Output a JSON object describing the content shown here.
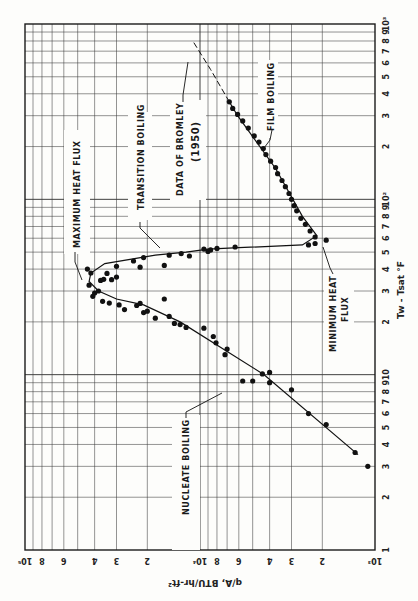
{
  "chart_data": {
    "type": "scatter",
    "orientation": "rotated-90",
    "title": "",
    "xlabel": "Tw - Tsat °F",
    "ylabel": "q/A, BTU/hr-ft²",
    "xscale": "log",
    "yscale": "log",
    "xlim": [
      1,
      1000
    ],
    "ylim": [
      1000,
      100000
    ],
    "grid": true,
    "x_ticks": [
      {
        "v": 1,
        "t": "1"
      },
      {
        "v": 2,
        "t": "2"
      },
      {
        "v": 3,
        "t": "3"
      },
      {
        "v": 4,
        "t": "4"
      },
      {
        "v": 5,
        "t": "5"
      },
      {
        "v": 6,
        "t": "6"
      },
      {
        "v": 7,
        "t": "7"
      },
      {
        "v": 8,
        "t": "8"
      },
      {
        "v": 9,
        "t": "9"
      },
      {
        "v": 10,
        "t": "10"
      },
      {
        "v": 20,
        "t": "2"
      },
      {
        "v": 30,
        "t": "3"
      },
      {
        "v": 40,
        "t": "4"
      },
      {
        "v": 50,
        "t": "5"
      },
      {
        "v": 60,
        "t": "6"
      },
      {
        "v": 70,
        "t": "7"
      },
      {
        "v": 80,
        "t": "8"
      },
      {
        "v": 90,
        "t": "9"
      },
      {
        "v": 100,
        "t": "10²"
      },
      {
        "v": 200,
        "t": "2"
      },
      {
        "v": 300,
        "t": "3"
      },
      {
        "v": 400,
        "t": "4"
      },
      {
        "v": 500,
        "t": "5"
      },
      {
        "v": 600,
        "t": "6"
      },
      {
        "v": 700,
        "t": "7"
      },
      {
        "v": 800,
        "t": "8"
      },
      {
        "v": 900,
        "t": "9"
      },
      {
        "v": 1000,
        "t": "10³"
      }
    ],
    "y_ticks": [
      {
        "v": 1000,
        "t": "10³"
      },
      {
        "v": 2000,
        "t": "2"
      },
      {
        "v": 3000,
        "t": "3"
      },
      {
        "v": 4000,
        "t": "4"
      },
      {
        "v": 6000,
        "t": "6"
      },
      {
        "v": 8000,
        "t": "8"
      },
      {
        "v": 10000,
        "t": "10⁴"
      },
      {
        "v": 20000,
        "t": "2"
      },
      {
        "v": 30000,
        "t": "3"
      },
      {
        "v": 40000,
        "t": "4"
      },
      {
        "v": 60000,
        "t": "6"
      },
      {
        "v": 80000,
        "t": "8"
      },
      {
        "v": 100000,
        "t": "10⁵"
      }
    ],
    "series": [
      {
        "name": "Experimental data",
        "kind": "points",
        "points": [
          [
            3.0,
            1100
          ],
          [
            3.6,
            1300
          ],
          [
            5.2,
            1900
          ],
          [
            6.0,
            2400
          ],
          [
            8.2,
            3000
          ],
          [
            9.0,
            4000
          ],
          [
            9.2,
            5000
          ],
          [
            9.2,
            5700
          ],
          [
            10.1,
            4400
          ],
          [
            10.3,
            4000
          ],
          [
            13.0,
            7200
          ],
          [
            14.0,
            7000
          ],
          [
            15.2,
            8100
          ],
          [
            16.5,
            8400
          ],
          [
            18.4,
            9500
          ],
          [
            18.6,
            12000
          ],
          [
            19.3,
            13000
          ],
          [
            19.6,
            14000
          ],
          [
            21.0,
            18000
          ],
          [
            21.5,
            15000
          ],
          [
            22.6,
            21000
          ],
          [
            23.0,
            20000
          ],
          [
            24.8,
            23000
          ],
          [
            25.5,
            22000
          ],
          [
            27.0,
            16000
          ],
          [
            23.5,
            27000
          ],
          [
            25.0,
            29000
          ],
          [
            25.6,
            33000
          ],
          [
            26.2,
            36000
          ],
          [
            28.0,
            41000
          ],
          [
            29.2,
            40000
          ],
          [
            30.0,
            38000
          ],
          [
            32.4,
            43000
          ],
          [
            34.5,
            37000
          ],
          [
            35.0,
            35500
          ],
          [
            34.8,
            32000
          ],
          [
            36.0,
            30000
          ],
          [
            37.8,
            34000
          ],
          [
            38.0,
            42000
          ],
          [
            40.0,
            44000
          ],
          [
            41.5,
            30000
          ],
          [
            41.0,
            22000
          ],
          [
            42.0,
            16000
          ],
          [
            44.5,
            24000
          ],
          [
            46.5,
            21000
          ],
          [
            48.0,
            15000
          ],
          [
            47.5,
            11500
          ],
          [
            49.0,
            12800
          ],
          [
            50.5,
            9000
          ],
          [
            51.5,
            8700
          ],
          [
            52.0,
            9500
          ],
          [
            52.5,
            8000
          ],
          [
            53.5,
            6300
          ],
          [
            55.0,
            2400
          ],
          [
            56.0,
            2200
          ],
          [
            58.5,
            1900
          ],
          [
            61.0,
            2200
          ],
          [
            66.0,
            2350
          ],
          [
            72.0,
            2500
          ],
          [
            78.0,
            2650
          ],
          [
            86.0,
            2800
          ],
          [
            92.0,
            2900
          ],
          [
            100.0,
            3000
          ],
          [
            108.0,
            3100
          ],
          [
            118.0,
            3250
          ],
          [
            128.0,
            3400
          ],
          [
            140.0,
            3600
          ],
          [
            152.0,
            3700
          ],
          [
            165.0,
            3950
          ],
          [
            180.0,
            4200
          ],
          [
            195.0,
            4350
          ],
          [
            212.0,
            4600
          ],
          [
            230.0,
            4900
          ],
          [
            255.0,
            5300
          ],
          [
            280.0,
            5700
          ],
          [
            305.0,
            6100
          ],
          [
            330.0,
            6500
          ],
          [
            360.0,
            6800
          ]
        ]
      },
      {
        "name": "Boiling curve (fit)",
        "kind": "line",
        "points": [
          [
            3.5,
            1250
          ],
          [
            10,
            4300
          ],
          [
            20,
            13000
          ],
          [
            25,
            21000
          ],
          [
            27,
            30000
          ],
          [
            30,
            38000
          ],
          [
            34,
            43000
          ],
          [
            38,
            42000
          ],
          [
            43,
            35000
          ],
          [
            48,
            18000
          ],
          [
            50,
            12000
          ],
          [
            52,
            9000
          ],
          [
            53,
            6000
          ],
          [
            55,
            2600
          ],
          [
            62,
            2150
          ],
          [
            80,
            2600
          ],
          [
            150,
            3700
          ],
          [
            300,
            6100
          ],
          [
            360,
            6800
          ]
        ]
      },
      {
        "name": "Data of Bromley (1950)",
        "kind": "dashed",
        "points": [
          [
            360,
            6800
          ],
          [
            550,
            8700
          ],
          [
            800,
            11000
          ]
        ]
      }
    ],
    "annotations": [
      {
        "text": "NUCLEATE BOILING"
      },
      {
        "text": "MAXIMUM HEAT FLUX"
      },
      {
        "text": "TRANSITION BOILING"
      },
      {
        "text": "DATA OF BROMLEY"
      },
      {
        "text": "(1950)"
      },
      {
        "text": "FILM BOILING"
      },
      {
        "text": "MINIMUM HEAT"
      },
      {
        "text": "FLUX"
      }
    ]
  }
}
